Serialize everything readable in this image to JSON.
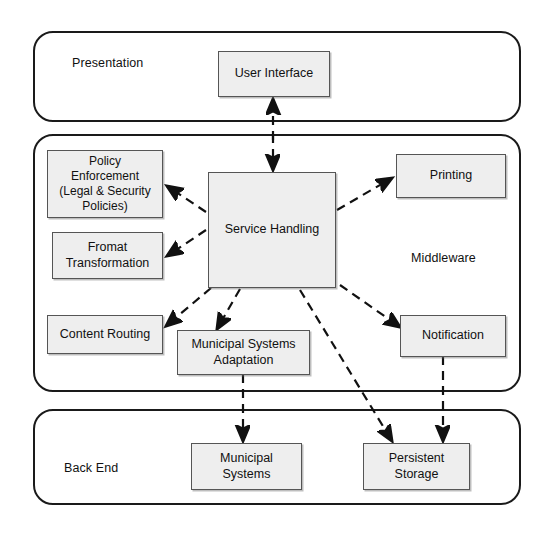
{
  "diagram": {
    "layers": [
      {
        "id": "presentation",
        "label": "Presentation"
      },
      {
        "id": "middleware",
        "label": "Middleware"
      },
      {
        "id": "backend",
        "label": "Back End"
      }
    ],
    "components": [
      {
        "id": "user-interface",
        "label": "User Interface",
        "layer": "presentation"
      },
      {
        "id": "policy-enforcement",
        "label": "Policy\nEnforcement\n(Legal & Security\nPolicies)",
        "layer": "middleware"
      },
      {
        "id": "fromat-transformation",
        "label": "Fromat\nTransformation",
        "layer": "middleware"
      },
      {
        "id": "content-routing",
        "label": "Content Routing",
        "layer": "middleware"
      },
      {
        "id": "service-handling",
        "label": "Service Handling",
        "layer": "middleware"
      },
      {
        "id": "municipal-systems-adaptation",
        "label": "Municipal Systems\nAdaptation",
        "layer": "middleware"
      },
      {
        "id": "printing",
        "label": "Printing",
        "layer": "middleware"
      },
      {
        "id": "notification",
        "label": "Notification",
        "layer": "middleware"
      },
      {
        "id": "municipal-systems",
        "label": "Municipal\nSystems",
        "layer": "backend"
      },
      {
        "id": "persistent-storage",
        "label": "Persistent\nStorage",
        "layer": "backend"
      }
    ],
    "connections": [
      {
        "from": "user-interface",
        "to": "service-handling",
        "style": "dashed",
        "arrows": "both"
      },
      {
        "from": "service-handling",
        "to": "policy-enforcement",
        "style": "dashed",
        "arrows": "end"
      },
      {
        "from": "service-handling",
        "to": "fromat-transformation",
        "style": "dashed",
        "arrows": "end"
      },
      {
        "from": "service-handling",
        "to": "content-routing",
        "style": "dashed",
        "arrows": "end"
      },
      {
        "from": "service-handling",
        "to": "municipal-systems-adaptation",
        "style": "dashed",
        "arrows": "end"
      },
      {
        "from": "service-handling",
        "to": "printing",
        "style": "dashed",
        "arrows": "end"
      },
      {
        "from": "service-handling",
        "to": "notification",
        "style": "dashed",
        "arrows": "end"
      },
      {
        "from": "service-handling",
        "to": "persistent-storage",
        "style": "dashed",
        "arrows": "end"
      },
      {
        "from": "municipal-systems-adaptation",
        "to": "municipal-systems",
        "style": "dashed",
        "arrows": "end"
      },
      {
        "from": "notification",
        "to": "persistent-storage",
        "style": "dashed",
        "arrows": "end"
      }
    ],
    "colors": {
      "box_fill": "#eeeeee",
      "box_border": "#555555",
      "layer_border": "#1a1a1a",
      "line": "#111111",
      "background": "#ffffff"
    }
  }
}
